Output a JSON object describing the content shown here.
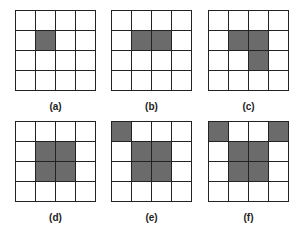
{
  "figure": {
    "panels": [
      {
        "label": "(a)",
        "filled": [
          [
            1,
            1
          ]
        ]
      },
      {
        "label": "(b)",
        "filled": [
          [
            1,
            1
          ],
          [
            1,
            2
          ]
        ]
      },
      {
        "label": "(c)",
        "filled": [
          [
            1,
            1
          ],
          [
            1,
            2
          ],
          [
            2,
            2
          ]
        ]
      },
      {
        "label": "(d)",
        "filled": [
          [
            1,
            1
          ],
          [
            1,
            2
          ],
          [
            2,
            1
          ],
          [
            2,
            2
          ]
        ]
      },
      {
        "label": "(e)",
        "filled": [
          [
            0,
            0
          ],
          [
            1,
            1
          ],
          [
            1,
            2
          ],
          [
            2,
            1
          ],
          [
            2,
            2
          ]
        ]
      },
      {
        "label": "(f)",
        "filled": [
          [
            0,
            0
          ],
          [
            0,
            3
          ],
          [
            1,
            1
          ],
          [
            1,
            2
          ],
          [
            2,
            1
          ],
          [
            2,
            2
          ]
        ]
      }
    ],
    "grid_size": 4,
    "colors": {
      "filled": "#6b6b6b",
      "empty": "#ffffff",
      "line": "#222222"
    }
  }
}
